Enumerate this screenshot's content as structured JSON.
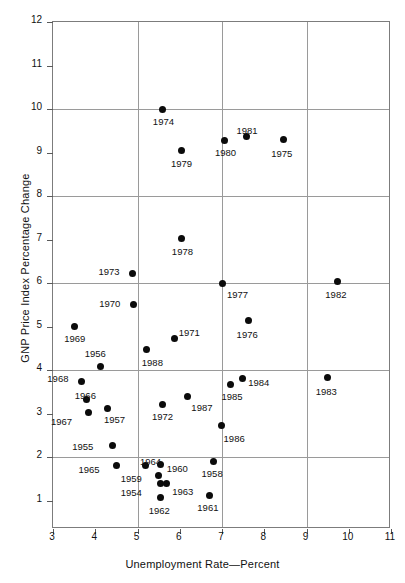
{
  "chart_data": {
    "type": "scatter",
    "title": "",
    "xlabel": "Unemployment Rate—Percent",
    "ylabel": "GNP Price Index Percentage Change",
    "xlim": [
      3,
      11
    ],
    "ylim": [
      0.35,
      12
    ],
    "xticks": [
      3,
      4,
      5,
      6,
      7,
      8,
      9,
      10,
      11
    ],
    "yticks": [
      1,
      2,
      3,
      4,
      5,
      6,
      7,
      8,
      9,
      10,
      11,
      12
    ],
    "xtick_labels": [
      "3",
      "4",
      "5",
      "6",
      "7",
      "8",
      "9",
      "10",
      "11"
    ],
    "ytick_labels": [
      "1",
      "2",
      "3",
      "4",
      "5",
      "6",
      "7",
      "8",
      "9",
      "10",
      "11",
      "12"
    ],
    "x_gridlines": [
      5,
      7,
      9
    ],
    "y_gridlines": [
      2,
      4,
      6,
      8,
      10,
      12
    ],
    "grid": true,
    "legend": "none",
    "marker_color": "#0b0b0b",
    "grid_color": "#9a9a9a",
    "frame_color": "#7c7c7c",
    "background_color": "#ffffff",
    "points": [
      {
        "label": "1954",
        "x": 5.55,
        "y": 1.4,
        "lx": -40,
        "ly": 4
      },
      {
        "label": "1955",
        "x": 4.4,
        "y": 2.28,
        "lx": -40,
        "ly": -4
      },
      {
        "label": "1956",
        "x": 4.13,
        "y": 4.09,
        "lx": -16,
        "ly": -18
      },
      {
        "label": "1957",
        "x": 4.3,
        "y": 3.13,
        "lx": -4,
        "ly": 6
      },
      {
        "label": "1958",
        "x": 6.8,
        "y": 1.9,
        "lx": -12,
        "ly": 6
      },
      {
        "label": "1959",
        "x": 5.5,
        "y": 1.57,
        "lx": -38,
        "ly": -3
      },
      {
        "label": "1960",
        "x": 5.55,
        "y": 1.83,
        "lx": 6,
        "ly": -2
      },
      {
        "label": "1961",
        "x": 6.7,
        "y": 1.13,
        "lx": -12,
        "ly": 7
      },
      {
        "label": "1962",
        "x": 5.55,
        "y": 1.08,
        "lx": -12,
        "ly": 8
      },
      {
        "label": "1963",
        "x": 5.68,
        "y": 1.4,
        "lx": 6,
        "ly": 3
      },
      {
        "label": "1964",
        "x": 5.2,
        "y": 1.8,
        "lx": -6,
        "ly": -10
      },
      {
        "label": "1965",
        "x": 4.5,
        "y": 1.81,
        "lx": -38,
        "ly": -1
      },
      {
        "label": "1966",
        "x": 3.8,
        "y": 3.32,
        "lx": -12,
        "ly": -10
      },
      {
        "label": "1967",
        "x": 3.85,
        "y": 3.03,
        "lx": -38,
        "ly": 4
      },
      {
        "label": "1968",
        "x": 3.67,
        "y": 3.75,
        "lx": -34,
        "ly": -8
      },
      {
        "label": "1969",
        "x": 3.5,
        "y": 5.01,
        "lx": -10,
        "ly": 7
      },
      {
        "label": "1970",
        "x": 4.9,
        "y": 5.5,
        "lx": -34,
        "ly": -7
      },
      {
        "label": "1973",
        "x": 4.88,
        "y": 6.23,
        "lx": -34,
        "ly": -7
      },
      {
        "label": "1971",
        "x": 5.88,
        "y": 4.73,
        "lx": 4,
        "ly": -11
      },
      {
        "label": "1972",
        "x": 5.58,
        "y": 3.22,
        "lx": -10,
        "ly": 7
      },
      {
        "label": "1974",
        "x": 5.6,
        "y": 9.99,
        "lx": -10,
        "ly": 7
      },
      {
        "label": "1975",
        "x": 8.45,
        "y": 9.3,
        "lx": -12,
        "ly": 8
      },
      {
        "label": "1976",
        "x": 7.63,
        "y": 5.13,
        "lx": -12,
        "ly": 8
      },
      {
        "label": "1977",
        "x": 7.0,
        "y": 6.0,
        "lx": 5,
        "ly": 6
      },
      {
        "label": "1978",
        "x": 6.05,
        "y": 7.02,
        "lx": -10,
        "ly": 7
      },
      {
        "label": "1979",
        "x": 6.03,
        "y": 9.05,
        "lx": -10,
        "ly": 8
      },
      {
        "label": "1980",
        "x": 7.07,
        "y": 9.28,
        "lx": -10,
        "ly": 7
      },
      {
        "label": "1981",
        "x": 7.58,
        "y": 9.38,
        "lx": -10,
        "ly": -11
      },
      {
        "label": "1982",
        "x": 9.73,
        "y": 6.03,
        "lx": -12,
        "ly": 7
      },
      {
        "label": "1983",
        "x": 9.5,
        "y": 3.82,
        "lx": -12,
        "ly": 8
      },
      {
        "label": "1984",
        "x": 7.48,
        "y": 3.8,
        "lx": 6,
        "ly": -2
      },
      {
        "label": "1985",
        "x": 7.2,
        "y": 3.68,
        "lx": -9,
        "ly": 7
      },
      {
        "label": "1986",
        "x": 6.99,
        "y": 2.72,
        "lx": 2,
        "ly": 7
      },
      {
        "label": "1987",
        "x": 6.18,
        "y": 3.4,
        "lx": 4,
        "ly": 6
      },
      {
        "label": "1988",
        "x": 5.22,
        "y": 4.48,
        "lx": -5,
        "ly": 8
      }
    ]
  }
}
